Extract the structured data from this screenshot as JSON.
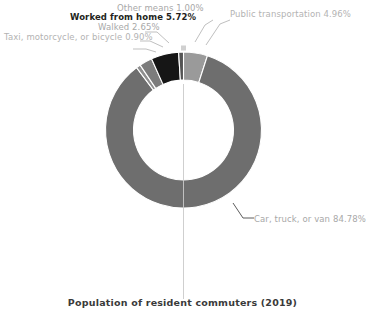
{
  "chart_data": {
    "type": "pie",
    "variant": "donut",
    "title": "Population of resident commuters (2019)",
    "xlabel": "",
    "ylabel": "",
    "units": "percent",
    "start_angle_deg": 0,
    "direction": "clockwise",
    "legend_position": "none",
    "grid": false,
    "labels_show_percent": true,
    "categories": [
      "Public transportation",
      "Car, truck, or van",
      "Taxi, motorcycle, or bicycle",
      "Walked",
      "Worked from home",
      "Other means"
    ],
    "values": [
      4.96,
      84.78,
      0.9,
      2.65,
      5.72,
      1.0
    ],
    "colors": [
      "#9a9a9a",
      "#6e6e6e",
      "#8f8f8f",
      "#7c7c7c",
      "#161616",
      "#545454"
    ],
    "slices": [
      {
        "label": "Public transportation",
        "value": 4.96,
        "display": "Public transportation 4.96%",
        "color": "#9a9a9a"
      },
      {
        "label": "Car, truck, or van",
        "value": 84.78,
        "display": "Car, truck, or van 84.78%",
        "color": "#6e6e6e"
      },
      {
        "label": "Taxi, motorcycle, or bicycle",
        "value": 0.9,
        "display": "Taxi, motorcycle, or bicycle 0.90%",
        "color": "#8f8f8f"
      },
      {
        "label": "Walked",
        "value": 2.65,
        "display": "Walked 2.65%",
        "color": "#7c7c7c"
      },
      {
        "label": "Worked from home",
        "value": 5.72,
        "display": "Worked from home 5.72%",
        "color": "#161616"
      },
      {
        "label": "Other means",
        "value": 1.0,
        "display": "Other means 1.00%",
        "color": "#545454"
      }
    ]
  },
  "annotations": {
    "label_public_transportation": "Public transportation 4.96%",
    "label_car_truck_van": "Car, truck, or van 84.78%",
    "label_taxi_motorcycle_bicycle": "Taxi, motorcycle, or bicycle 0.90%",
    "label_walked": "Walked 2.65%",
    "label_worked_from_home": "Worked from home 5.72%",
    "label_other_means": "Other means 1.00%"
  },
  "footer": {
    "title": "Population of resident commuters (2019)"
  },
  "colors": {
    "background": "#ffffff",
    "leader_line": "#b8b8b8",
    "label_muted": "#b3b3b3",
    "label_emphasis": "#231f20"
  }
}
